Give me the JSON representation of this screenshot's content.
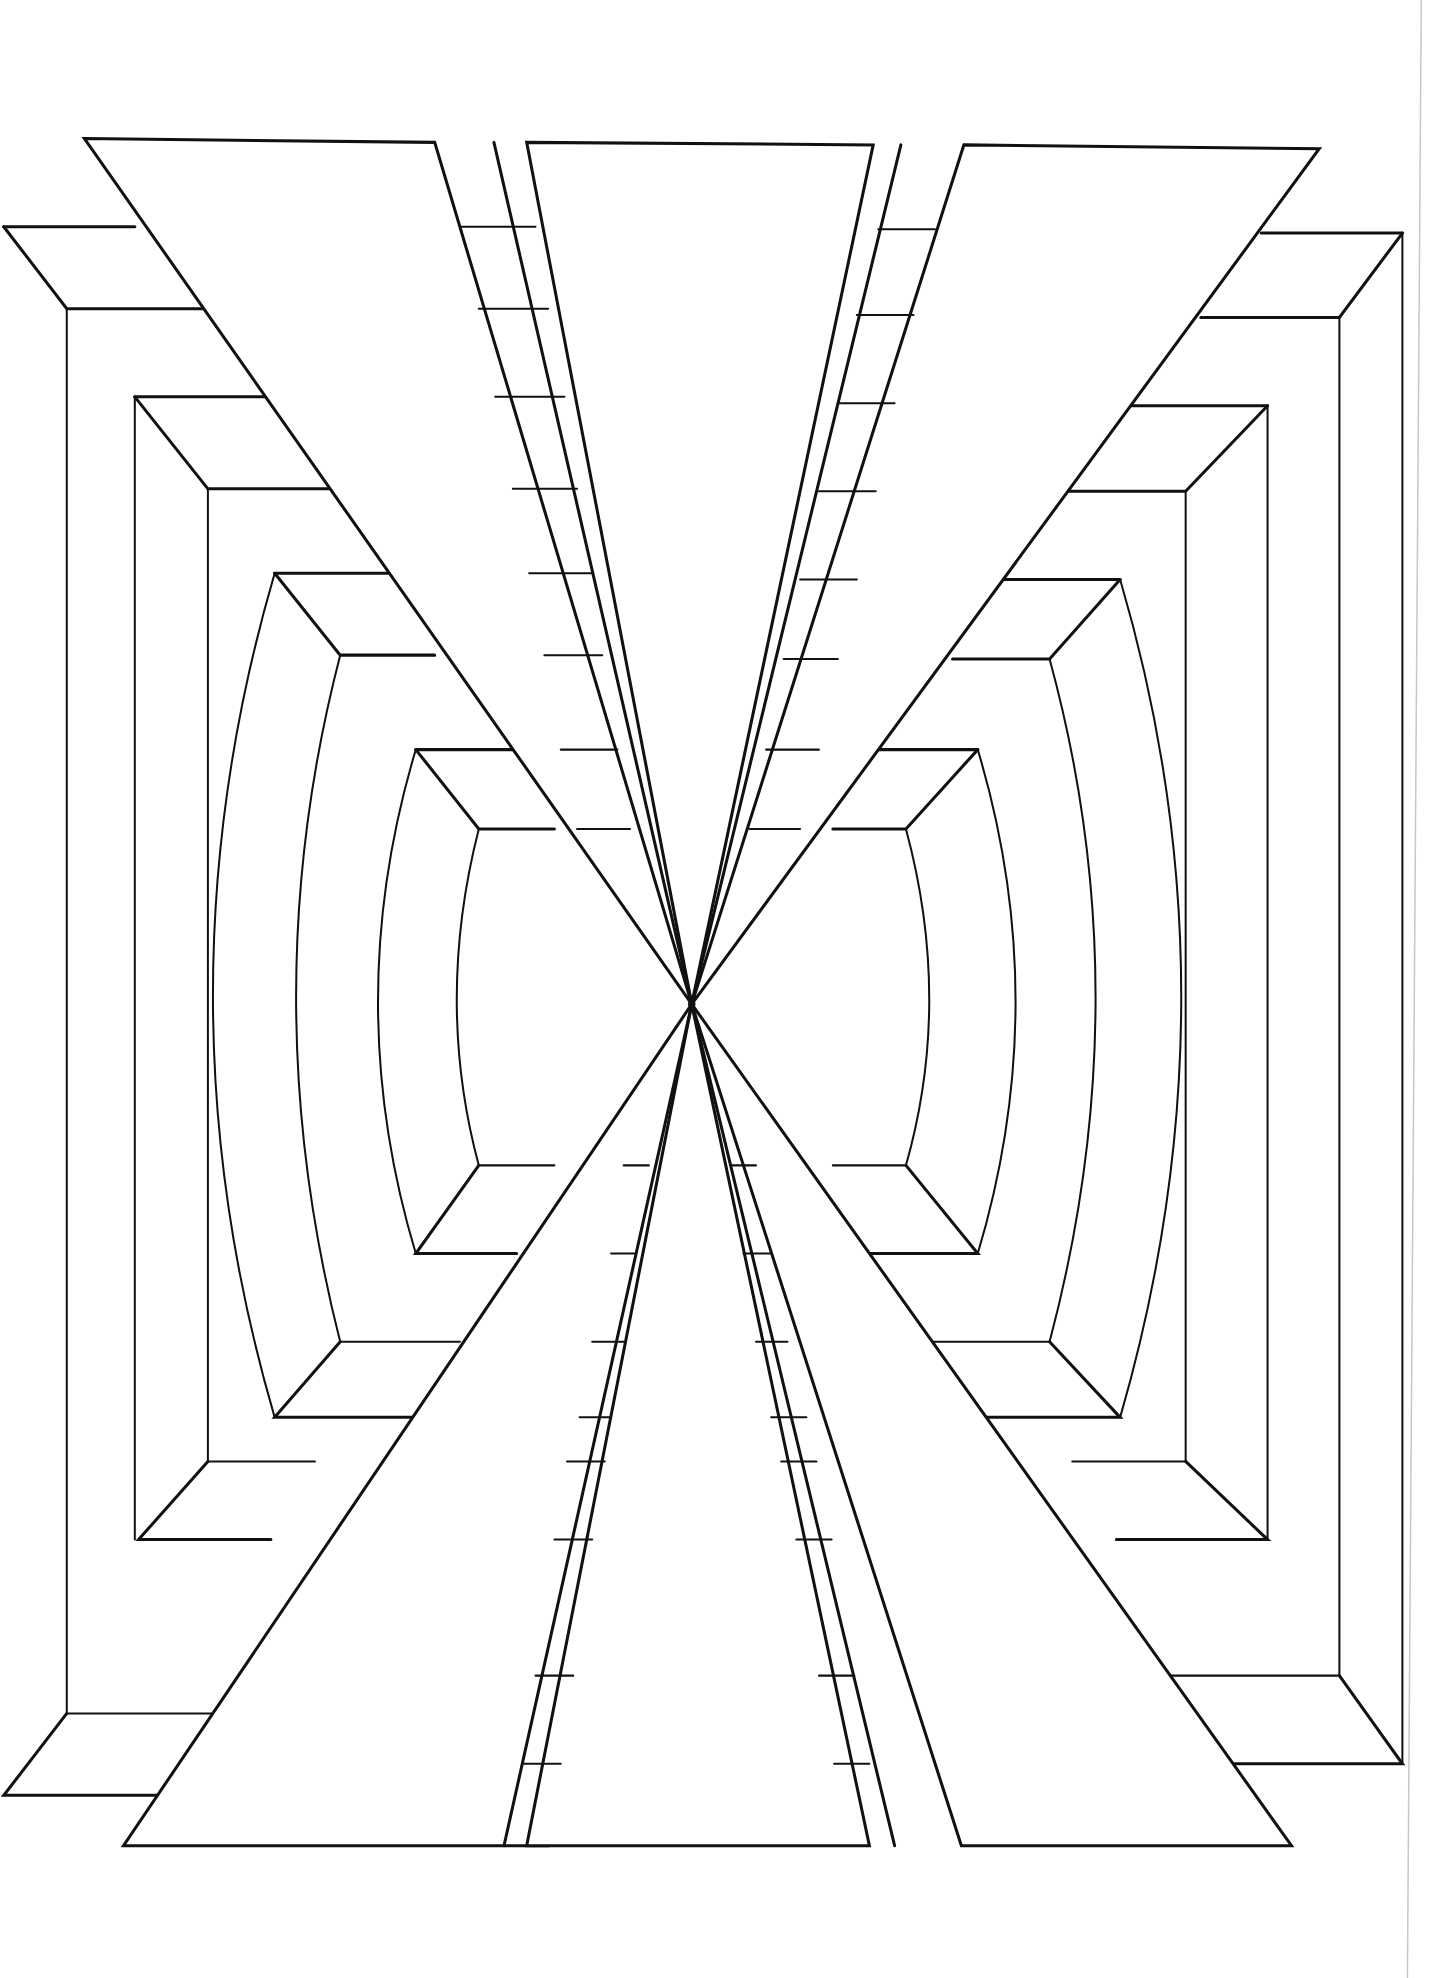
{
  "artwork": {
    "kind": "op-art line drawing",
    "subject": "symmetric perspective composition converging to a central vanishing point",
    "colors": {
      "background": "#ffffff",
      "ink": "#111111",
      "page_edge": "#c8c8c8"
    },
    "vanishing_point": {
      "x": 692,
      "y": 1004
    },
    "elements": {
      "wedges": 6,
      "nested_frames_per_side": 4,
      "central_ladder_strips": 2
    }
  }
}
